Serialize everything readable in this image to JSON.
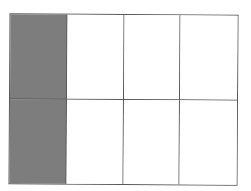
{
  "diagram": {
    "type": "fraction-area-model",
    "rows": 2,
    "columns": 4,
    "total_cells": 8,
    "shaded_cells": 2,
    "shaded_positions": [
      {
        "row": 1,
        "column": 1
      },
      {
        "row": 2,
        "column": 1
      }
    ],
    "colors": {
      "shaded_fill": "#7d7d7d",
      "unshaded_fill": "#ffffff",
      "line": "#585858",
      "background": "#ffffff"
    },
    "cells": [
      {
        "row": 1,
        "column": 1,
        "shaded": true
      },
      {
        "row": 1,
        "column": 2,
        "shaded": false
      },
      {
        "row": 1,
        "column": 3,
        "shaded": false
      },
      {
        "row": 1,
        "column": 4,
        "shaded": false
      },
      {
        "row": 2,
        "column": 1,
        "shaded": true
      },
      {
        "row": 2,
        "column": 2,
        "shaded": false
      },
      {
        "row": 2,
        "column": 3,
        "shaded": false
      },
      {
        "row": 2,
        "column": 4,
        "shaded": false
      }
    ]
  }
}
